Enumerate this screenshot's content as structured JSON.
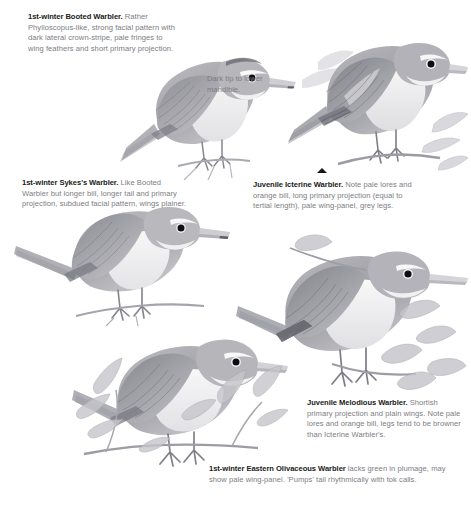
{
  "page": {
    "width": 471,
    "height": 526,
    "background": "#ffffff",
    "kind": "field-guide-plate",
    "text_color_body": "#7d7d83",
    "text_color_lead": "#1b1b20",
    "artwork_tone": "#9a9aa0"
  },
  "captions": [
    {
      "id": "booted",
      "lead": "1st-winter Booted Warbler.",
      "body": " Rather Phylloscopus-like, strong facial pattern with dark lateral crown-stripe, pale fringes to wing feathers and short primary projection.",
      "x": 28,
      "y": 12,
      "width": 152,
      "align": "left"
    },
    {
      "id": "mandible",
      "lead": "",
      "body": "Dark tip to lower mandible.",
      "x": 207,
      "y": 74,
      "width": 90,
      "align": "left"
    },
    {
      "id": "sykes",
      "lead": "1st-winter Sykes's Warbler.",
      "body": " Like Booted Warbler but longer bill, longer tail and primary projection, subdued facial pattern, wings plainer.",
      "x": 22,
      "y": 178,
      "width": 166,
      "align": "left"
    },
    {
      "id": "icterine",
      "lead": "Juvenile Icterine Warbler.",
      "body": " Note pale lores and orange bill, long primary projection (equal to tertial length), pale wing-panel, grey legs.",
      "x": 253,
      "y": 180,
      "width": 160,
      "align": "left"
    },
    {
      "id": "melodious",
      "lead": "Juvenile Melodious Warbler.",
      "body": " Shortish primary projection and plain wings. Note pale lores and orange bill, legs tend to be browner than Icterine Warbler's.",
      "x": 307,
      "y": 398,
      "width": 158,
      "align": "left"
    },
    {
      "id": "olivaceous",
      "lead": "1st-winter Eastern Olivaceous Warbler",
      "body": " lacks green in plumage, may show pale wing-panel. 'Pumps' tail rhythmically with tok calls.",
      "x": 209,
      "y": 464,
      "width": 254,
      "align": "left"
    }
  ],
  "markers": [
    {
      "id": "icterine-pointer",
      "shape": "triangle-up",
      "x": 317,
      "y": 168
    }
  ],
  "birds": [
    {
      "id": "booted-warbler",
      "species": "1st-winter Booted Warbler",
      "x": 118,
      "y": 28,
      "width": 178,
      "height": 152,
      "facing": "right"
    },
    {
      "id": "icterine-warbler",
      "species": "Juvenile Icterine Warbler",
      "x": 288,
      "y": 18,
      "width": 180,
      "height": 165,
      "facing": "right"
    },
    {
      "id": "sykes-warbler",
      "species": "1st-winter Sykes's Warbler",
      "x": 14,
      "y": 196,
      "width": 216,
      "height": 130,
      "facing": "right"
    },
    {
      "id": "melodious-warbler",
      "species": "Juvenile Melodious Warbler",
      "x": 236,
      "y": 232,
      "width": 232,
      "height": 168,
      "facing": "right"
    },
    {
      "id": "olivaceous-warbler",
      "species": "1st-winter Eastern Olivaceous Warbler",
      "x": 72,
      "y": 326,
      "width": 216,
      "height": 146,
      "facing": "right"
    }
  ]
}
